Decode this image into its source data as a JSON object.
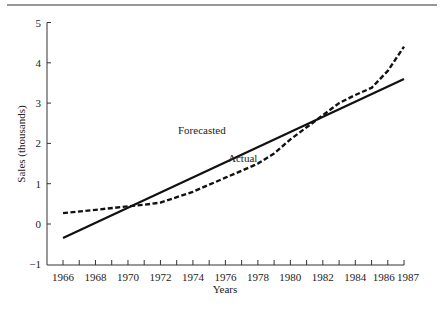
{
  "chart_data": {
    "type": "line",
    "title": "",
    "xlabel": "Years",
    "ylabel": "Sales (thousands)",
    "xlim": [
      1965.3,
      1987
    ],
    "ylim": [
      -1,
      5
    ],
    "grid": false,
    "legend": "inline labels",
    "x_ticks": [
      1966,
      1967,
      1968,
      1969,
      1970,
      1971,
      1972,
      1973,
      1974,
      1975,
      1976,
      1977,
      1978,
      1979,
      1980,
      1981,
      1982,
      1983,
      1984,
      1985,
      1986,
      1987
    ],
    "x_tick_labels": [
      "1966",
      "1968",
      "1970",
      "1972",
      "1974",
      "1976",
      "1978",
      "1980",
      "1982",
      "1984",
      "1986",
      "1987"
    ],
    "y_tick_labels": [
      "-1",
      "0",
      "1",
      "2",
      "3",
      "4",
      "5"
    ],
    "series": [
      {
        "name": "Forecasted",
        "style": "solid",
        "x": [
          1966,
          1987
        ],
        "values": [
          -0.35,
          3.6
        ]
      },
      {
        "name": "Actual",
        "style": "dashed",
        "x": [
          1966,
          1968,
          1970,
          1971,
          1972,
          1974,
          1976,
          1978,
          1979,
          1980,
          1981,
          1982,
          1983,
          1984,
          1985,
          1986,
          1987
        ],
        "values": [
          0.27,
          0.35,
          0.44,
          0.48,
          0.53,
          0.8,
          1.15,
          1.5,
          1.75,
          2.1,
          2.4,
          2.7,
          3.0,
          3.2,
          3.38,
          3.8,
          4.4
        ]
      }
    ],
    "annotations": [
      {
        "text": "Forecasted",
        "x": 1975.5,
        "y": 1.6
      },
      {
        "text": "Actual",
        "x": 1976.5,
        "y": 1.0
      }
    ]
  },
  "labels": {
    "forecast": "Forecasted",
    "actual": "Actual",
    "xlabel": "Years",
    "ylabel": "Sales (thousands)"
  }
}
